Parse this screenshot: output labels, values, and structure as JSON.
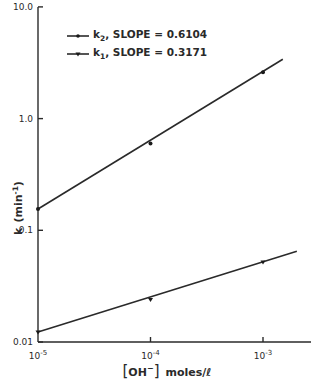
{
  "chart_data": {
    "type": "line",
    "title": "",
    "xlabel": "[OH⁻] moles/ℓ",
    "ylabel": "k (min⁻¹)",
    "xscale": "log",
    "yscale": "log",
    "xlim": [
      1e-05,
      0.002
    ],
    "ylim": [
      0.01,
      10.0
    ],
    "grid": false,
    "legend_position": "upper-left",
    "x_ticks": [
      {
        "value": 1e-05,
        "base": "10",
        "exp": "-5"
      },
      {
        "value": 0.0001,
        "base": "10",
        "exp": "-4"
      },
      {
        "value": 0.001,
        "base": "10",
        "exp": "-3"
      }
    ],
    "y_ticks": [
      {
        "value": 10.0,
        "label": "10.0"
      },
      {
        "value": 1.0,
        "label": "1.0"
      },
      {
        "value": 0.1,
        "label": "0.1"
      },
      {
        "value": 0.01,
        "label": "0.01"
      }
    ],
    "series": [
      {
        "name": "k2",
        "legend_sub": "2",
        "legend_text": ", SLOPE = 0.6104",
        "slope": 0.6104,
        "marker": "dot",
        "x": [
          1e-05,
          0.0001,
          0.001
        ],
        "y": [
          0.155,
          0.6,
          2.6
        ],
        "line_end": {
          "x": 0.0015,
          "y": 3.4
        }
      },
      {
        "name": "k1",
        "legend_sub": "1",
        "legend_text": ", SLOPE = 0.3171",
        "slope": 0.3171,
        "marker": "triangle",
        "x": [
          1e-05,
          0.0001,
          0.001
        ],
        "y": [
          0.0123,
          0.024,
          0.052
        ],
        "line_end": {
          "x": 0.002,
          "y": 0.065
        }
      }
    ]
  },
  "labels": {
    "legend_k": "k",
    "ylabel_k": "k",
    "ylabel_unit": "(min",
    "ylabel_exp": "-1",
    "ylabel_close": ")",
    "xlabel_open": "[",
    "xlabel_ion": "OH",
    "xlabel_charge": "−",
    "xlabel_close": "]",
    "xlabel_unit": "moles/ℓ"
  }
}
